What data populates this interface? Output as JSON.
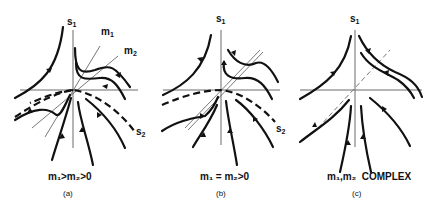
{
  "figure": {
    "panels": [
      {
        "id": "a",
        "label": "(a)",
        "condition": "m₁>m₂>0",
        "axis_labels": {
          "vertical": "s₁",
          "separatrix": "s₂",
          "eigen1": "m₁",
          "eigen2": "m₂"
        }
      },
      {
        "id": "b",
        "label": "(b)",
        "condition": "m₁ = m₂>0",
        "axis_labels": {
          "vertical": "s₁",
          "separatrix": "s₂"
        }
      },
      {
        "id": "c",
        "label": "(c)",
        "condition": "m₁,m₂  COMPLEX",
        "axis_labels": {
          "vertical": "s₁"
        }
      }
    ],
    "colors": {
      "curve": "#111111",
      "axis": "#6a6a6a",
      "background": "#ffffff"
    }
  }
}
